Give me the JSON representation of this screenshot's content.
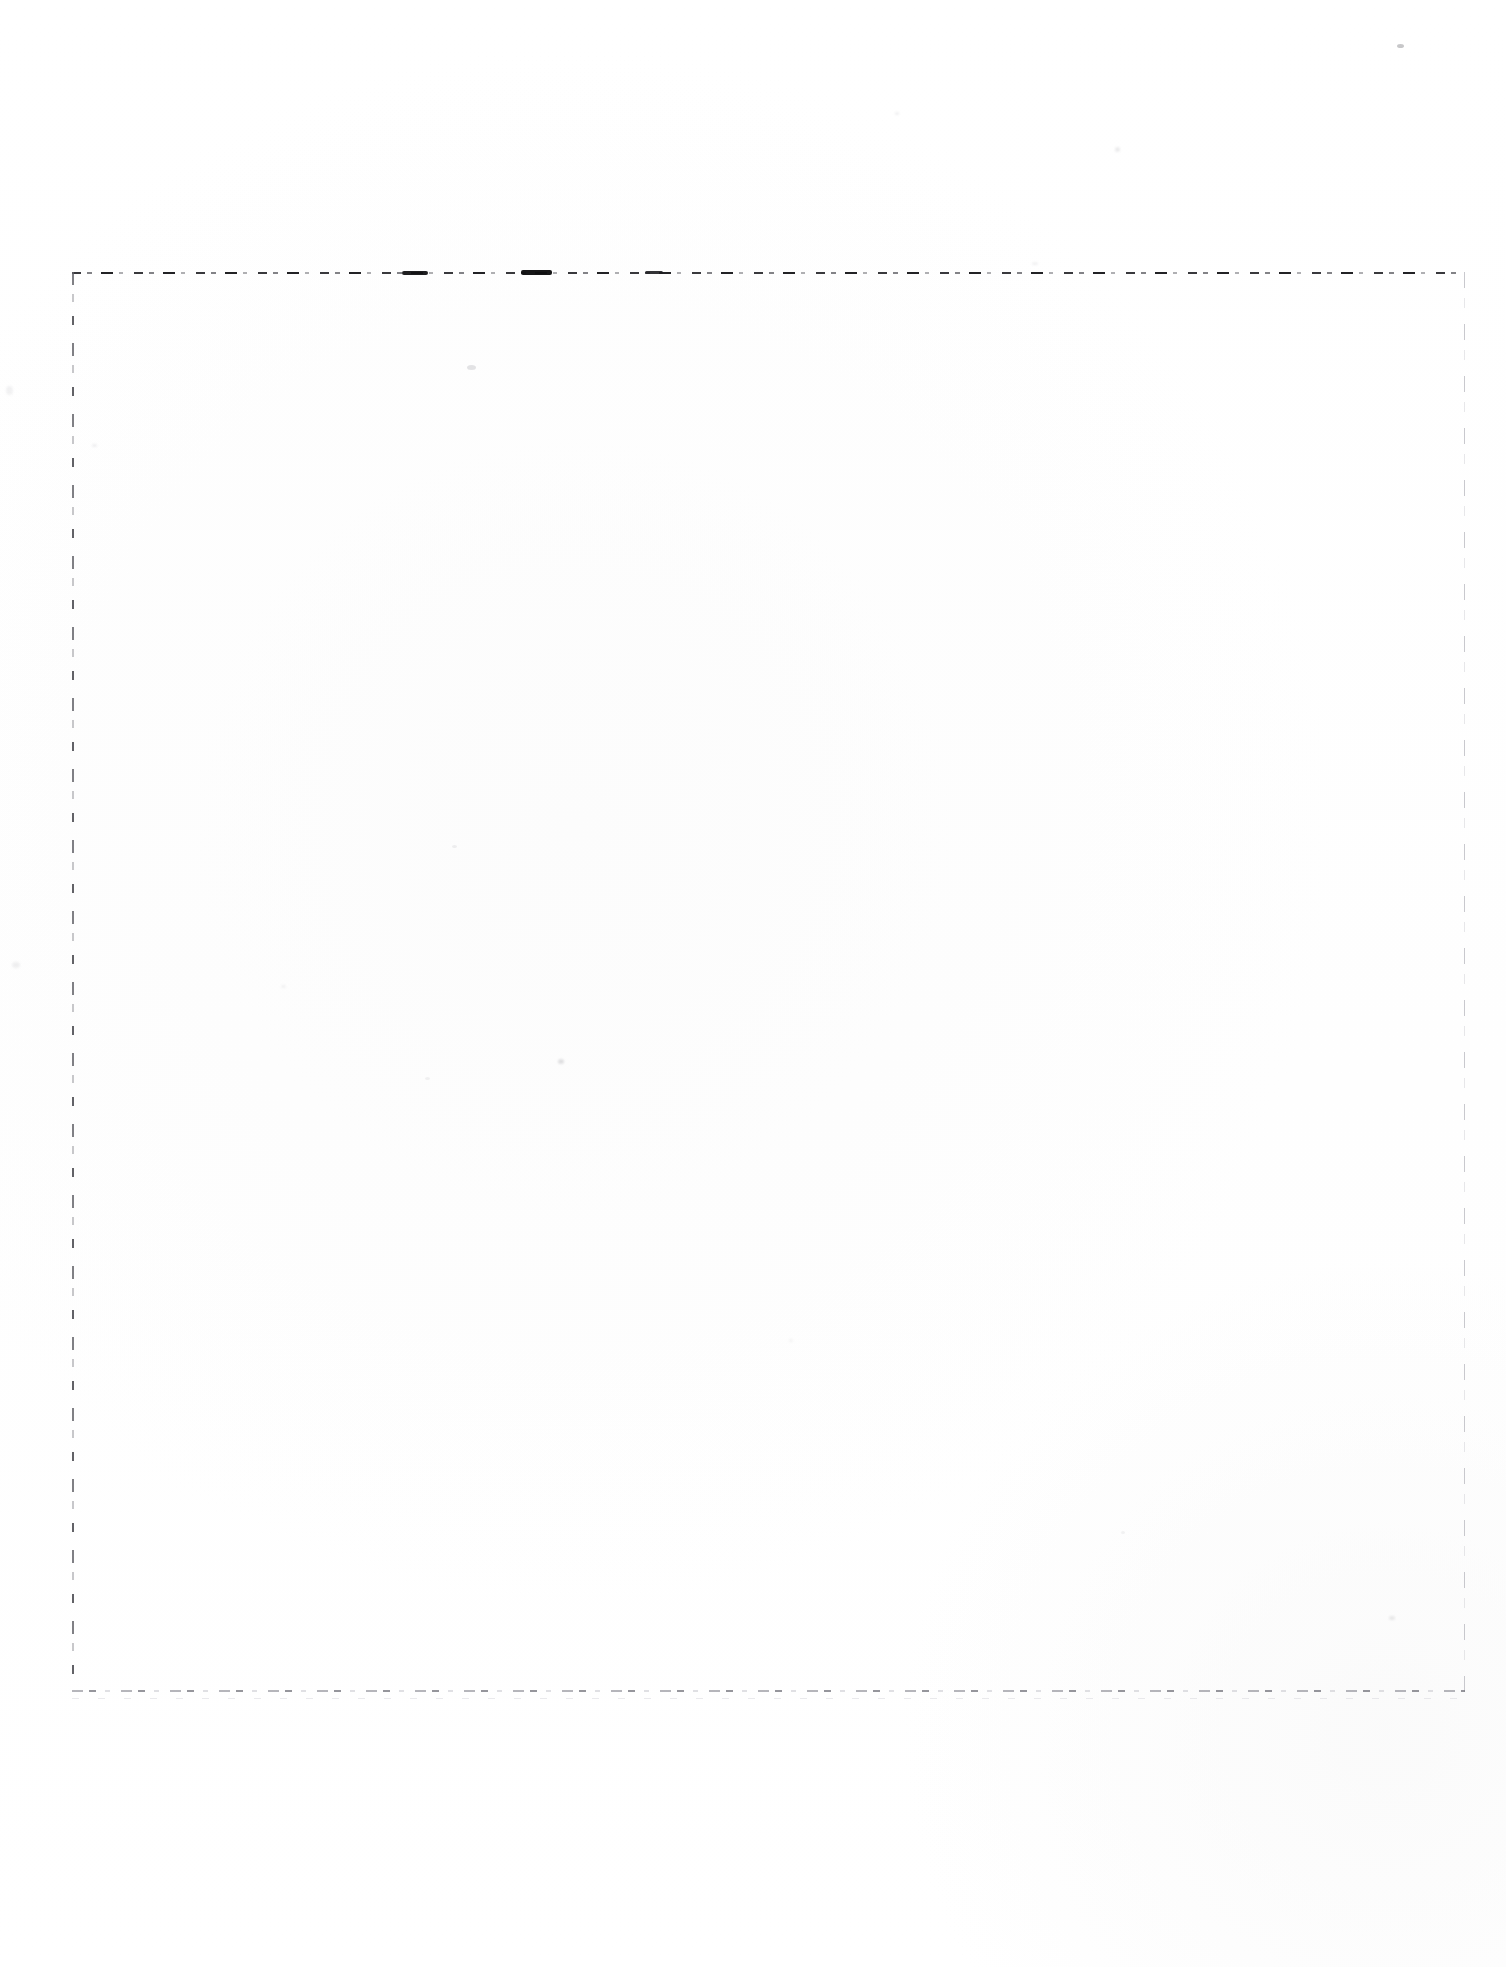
{
  "document": {
    "kind": "scanned-page",
    "page_label": "blank page",
    "width_px": 1506,
    "height_px": 1967,
    "background_color": "#ffffff",
    "text_content": "",
    "visible_text": []
  },
  "guide_box": {
    "name": "dashed crop guide rectangle",
    "left_px": 72,
    "top_px": 272,
    "right_px": 1465,
    "bottom_px": 1692,
    "width_px": 1393,
    "height_px": 1420,
    "stroke_style": "dashed",
    "edges": {
      "top": {
        "label": "top guide rule",
        "color": "#28282c",
        "weight": "dark"
      },
      "left": {
        "label": "left guide rule",
        "color": "#606066",
        "weight": "medium"
      },
      "right": {
        "label": "right guide rule",
        "color": "#a8a8b0",
        "weight": "light"
      },
      "bottom": {
        "label": "bottom guide rule",
        "color": "#96969e",
        "weight": "light"
      }
    }
  },
  "artifacts": {
    "label": "scanner dust specks",
    "specks": [
      {
        "x": 1397,
        "y": 44,
        "w": 7,
        "h": 4,
        "opacity": 0.34
      },
      {
        "x": 1115,
        "y": 147,
        "w": 5,
        "h": 5,
        "opacity": 0.12
      },
      {
        "x": 895,
        "y": 112,
        "w": 4,
        "h": 3,
        "opacity": 0.1
      },
      {
        "x": 467,
        "y": 365,
        "w": 9,
        "h": 5,
        "opacity": 0.16
      },
      {
        "x": 1032,
        "y": 262,
        "w": 6,
        "h": 3,
        "opacity": 0.09
      },
      {
        "x": 92,
        "y": 444,
        "w": 5,
        "h": 3,
        "opacity": 0.1
      },
      {
        "x": 452,
        "y": 845,
        "w": 5,
        "h": 3,
        "opacity": 0.09
      },
      {
        "x": 281,
        "y": 985,
        "w": 5,
        "h": 3,
        "opacity": 0.08
      },
      {
        "x": 558,
        "y": 1059,
        "w": 6,
        "h": 5,
        "opacity": 0.18
      },
      {
        "x": 425,
        "y": 1077,
        "w": 5,
        "h": 3,
        "opacity": 0.08
      },
      {
        "x": 1389,
        "y": 1616,
        "w": 6,
        "h": 4,
        "opacity": 0.12
      },
      {
        "x": 789,
        "y": 1339,
        "w": 4,
        "h": 3,
        "opacity": 0.07
      },
      {
        "x": 1121,
        "y": 1531,
        "w": 4,
        "h": 3,
        "opacity": 0.07
      },
      {
        "x": 12,
        "y": 962,
        "w": 8,
        "h": 6,
        "opacity": 0.09
      },
      {
        "x": 6,
        "y": 386,
        "w": 7,
        "h": 9,
        "opacity": 0.08
      }
    ]
  }
}
